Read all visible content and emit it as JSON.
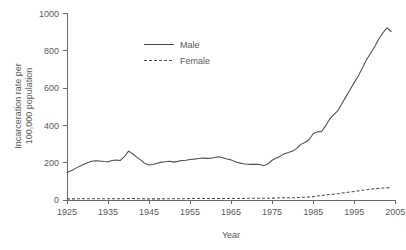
{
  "chart_data": {
    "type": "line",
    "title": "",
    "xlabel": "Year",
    "ylabel": "Incarceration rate per 100,000 population",
    "ylabel_line1": "Incarceration rate per",
    "ylabel_line2": "100,000 population",
    "xlim": [
      1925,
      2005
    ],
    "ylim": [
      0,
      1000
    ],
    "xticks": [
      1925,
      1935,
      1945,
      1955,
      1965,
      1975,
      1985,
      1995,
      2005
    ],
    "xtick_labels": [
      "1925",
      "1935",
      "1945",
      "1955",
      "1965",
      "1975",
      "1985",
      "1995",
      "2005"
    ],
    "yticks": [
      0,
      200,
      400,
      600,
      800,
      1000
    ],
    "ytick_labels": [
      "0",
      "200",
      "400",
      "600",
      "800",
      "1000"
    ],
    "grid": false,
    "legend_position": "upper-center",
    "legend_entries": [
      {
        "name": "Male",
        "style": "solid"
      },
      {
        "name": "Female",
        "style": "dashed"
      }
    ],
    "x": [
      1925,
      1926,
      1927,
      1928,
      1929,
      1930,
      1931,
      1932,
      1933,
      1934,
      1935,
      1936,
      1937,
      1938,
      1939,
      1940,
      1941,
      1942,
      1943,
      1944,
      1945,
      1946,
      1947,
      1948,
      1949,
      1950,
      1951,
      1952,
      1953,
      1954,
      1955,
      1956,
      1957,
      1958,
      1959,
      1960,
      1961,
      1962,
      1963,
      1964,
      1965,
      1966,
      1967,
      1968,
      1969,
      1970,
      1971,
      1972,
      1973,
      1974,
      1975,
      1976,
      1977,
      1978,
      1979,
      1980,
      1981,
      1982,
      1983,
      1984,
      1985,
      1986,
      1987,
      1988,
      1989,
      1990,
      1991,
      1992,
      1993,
      1994,
      1995,
      1996,
      1997,
      1998,
      1999,
      2000,
      2001,
      2002,
      2003,
      2004
    ],
    "series": [
      {
        "name": "Male",
        "style": "solid",
        "values": [
          147,
          157,
          168,
          180,
          190,
          200,
          208,
          210,
          209,
          206,
          205,
          212,
          214,
          212,
          232,
          262,
          248,
          230,
          214,
          195,
          188,
          190,
          197,
          203,
          205,
          208,
          203,
          207,
          212,
          213,
          217,
          219,
          222,
          225,
          223,
          224,
          228,
          232,
          226,
          220,
          215,
          205,
          199,
          194,
          192,
          191,
          192,
          190,
          183,
          194,
          213,
          225,
          235,
          248,
          254,
          262,
          277,
          298,
          308,
          323,
          355,
          365,
          366,
          396,
          433,
          458,
          478,
          516,
          554,
          591,
          629,
          665,
          707,
          752,
          786,
          821,
          863,
          896,
          923,
          903
        ]
      },
      {
        "name": "Female",
        "style": "dashed",
        "values": [
          6,
          6,
          6,
          7,
          7,
          7,
          7,
          7,
          7,
          7,
          7,
          7,
          7,
          7,
          7,
          8,
          8,
          7,
          7,
          6,
          6,
          6,
          6,
          6,
          7,
          7,
          7,
          7,
          7,
          7,
          8,
          8,
          8,
          8,
          8,
          8,
          8,
          8,
          8,
          8,
          8,
          8,
          8,
          8,
          9,
          9,
          9,
          9,
          9,
          9,
          10,
          11,
          12,
          12,
          12,
          12,
          13,
          14,
          15,
          16,
          17,
          21,
          23,
          27,
          29,
          31,
          34,
          37,
          40,
          43,
          46,
          49,
          52,
          55,
          58,
          60,
          62,
          64,
          66,
          64
        ]
      }
    ],
    "final_values": {
      "male": 923,
      "female": 66
    },
    "peak_male": {
      "year": 2003,
      "value": 923
    }
  },
  "figure": {
    "background": "#ffffff",
    "line_color": "#4d4d4d",
    "axis_color": "#5a5a5a",
    "text_color": "#5a5a5a"
  }
}
